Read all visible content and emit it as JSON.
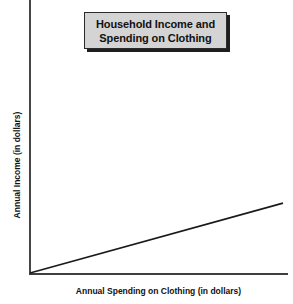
{
  "chart_data": {
    "type": "line",
    "title": "Household Income and\nSpending on Clothing",
    "title_line_1": "Household Income and",
    "title_line_2": "Spending on Clothing",
    "xlabel": "Annual Spending on Clothing (in dollars)",
    "ylabel": "Annual Income (in dollars)",
    "grid": false,
    "legend": false,
    "xlim": [
      0,
      100
    ],
    "ylim": [
      0,
      100
    ],
    "xticks": [],
    "yticks": [],
    "series": [
      {
        "name": "trend",
        "x": [
          0,
          100
        ],
        "y": [
          0,
          25.6
        ],
        "style": "solid",
        "color": "#1a1a1a",
        "width": 1.6
      }
    ],
    "annotations": []
  },
  "axes": {
    "y_axis_color": "#464646",
    "x_axis_color": "#3f3f3f"
  },
  "title_box": {
    "fill": "#d4d4d4",
    "border": "#2b2b2b",
    "shadow": "#1e1e1e"
  },
  "colors": {
    "background": "#ffffff",
    "text": "#111111",
    "line": "#1a1a1a"
  }
}
